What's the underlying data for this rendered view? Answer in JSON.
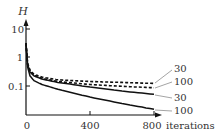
{
  "chart_data": {
    "type": "line",
    "title": "",
    "xlabel": "iterations",
    "ylabel": "H",
    "yscale": "log",
    "xlim": [
      0,
      800
    ],
    "ylim": [
      0.01,
      15
    ],
    "grid": false,
    "x_ticks": [
      "0",
      "400",
      "800"
    ],
    "y_ticks": [
      "10",
      "1",
      "0.1"
    ],
    "legend_position": "inline labels at right end of curves",
    "series": [
      {
        "name": "30",
        "style": "dashed",
        "x": [
          0,
          10,
          25,
          50,
          100,
          200,
          400,
          600,
          800
        ],
        "values": [
          3.0,
          0.6,
          0.35,
          0.25,
          0.2,
          0.16,
          0.14,
          0.13,
          0.12
        ]
      },
      {
        "name": "100",
        "style": "dashed",
        "x": [
          0,
          10,
          25,
          50,
          100,
          200,
          400,
          600,
          800
        ],
        "values": [
          3.0,
          0.55,
          0.32,
          0.23,
          0.18,
          0.14,
          0.11,
          0.095,
          0.085
        ]
      },
      {
        "name": "30",
        "style": "solid",
        "x": [
          0,
          10,
          25,
          50,
          100,
          200,
          400,
          600,
          800
        ],
        "values": [
          3.0,
          0.55,
          0.3,
          0.22,
          0.17,
          0.13,
          0.09,
          0.065,
          0.05
        ]
      },
      {
        "name": "100",
        "style": "solid",
        "x": [
          0,
          10,
          25,
          50,
          100,
          200,
          400,
          600,
          800
        ],
        "values": [
          3.0,
          0.45,
          0.22,
          0.15,
          0.11,
          0.075,
          0.04,
          0.024,
          0.015
        ]
      }
    ]
  },
  "labels": {
    "ylabel": "H",
    "xlabel": "iterations",
    "x_ticks": [
      "0",
      "400",
      "800"
    ],
    "y_ticks": [
      "10",
      "1",
      "0.1"
    ],
    "series_labels": [
      "30",
      "100",
      "30",
      "100"
    ]
  }
}
